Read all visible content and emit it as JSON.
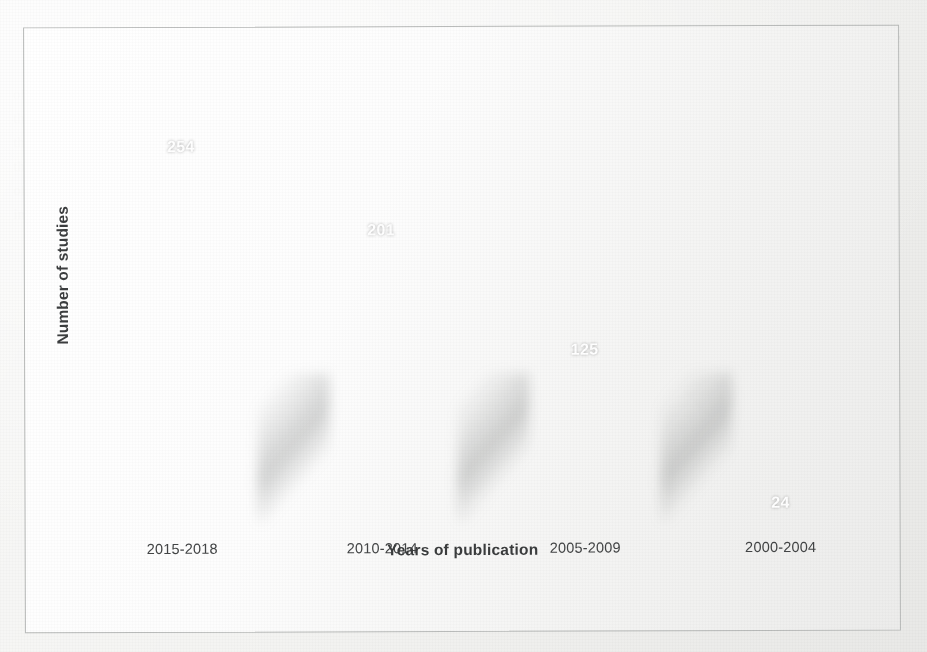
{
  "chart_data": {
    "type": "bar",
    "title": "",
    "subtitle": "",
    "xlabel": "Years of publication",
    "ylabel": "Number of studies",
    "categories": [
      "2015-2018",
      "2010-2014",
      "2005-2009",
      "2000-2004"
    ],
    "values": [
      254,
      201,
      125,
      24
    ],
    "series": [
      {
        "name": "Number of studies",
        "values": [
          254,
          201,
          125,
          24
        ]
      }
    ],
    "value_labels": [
      "254",
      "201",
      "125",
      "24"
    ],
    "value_label_position": "inside-top",
    "ylim": [
      0,
      280
    ],
    "grid": false,
    "legend": false,
    "legend_position": "none",
    "axis_tick_labels_y": [],
    "orientation": "vertical",
    "bar_color": "#6a6d6c",
    "value_label_color": "#ffffff",
    "axis_label_color": "#3b3d3e",
    "plot_background": "#fdfdfd",
    "frame_border_color": "#b9bbba"
  },
  "figure": {
    "y_axis_title": "Number of studies",
    "x_axis_title": "Years of publication",
    "bars": [
      {
        "category": "2015-2018",
        "value": 254,
        "label": "254"
      },
      {
        "category": "2010-2014",
        "value": 201,
        "label": "201"
      },
      {
        "category": "2005-2009",
        "value": 125,
        "label": "125"
      },
      {
        "category": "2000-2004",
        "value": 24,
        "label": "24"
      }
    ]
  },
  "scan_artifacts": {
    "bleed_text_right": "the the th of the of and the the of the and for of in a the that was and were of the of with in the to the of the in and on the and a as of the of the and the in to a of the that the of and the in of the on for the a and the to of the in the and of a the of the for and in the that of to the and the of the a in the and of the the to and of the in for the a of the and",
    "bleed_text_left": "of the and in a to the of and the for in of a the and that the in of to the a of and for the in the and of a to the in of the and the of in a to the and for of the in the a and of the to the in of and the for a in of the and the of the to a in the and of the for the in of and a the",
    "bleed_text_bottom": "and the in of a to the of and for the in the a of and that the to in of the and the a for of the in the and to of a the in the of and the for in a to the of and the in the of a and the to for the in of the and of a the in to the and for the of in a the"
  }
}
